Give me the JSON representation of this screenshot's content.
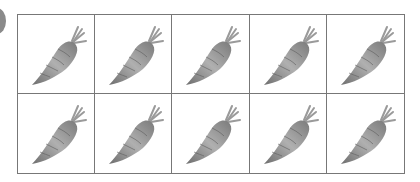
{
  "figure": {
    "item": "carrot",
    "icon": "carrot-icon",
    "rows": 2,
    "columns": 5,
    "count": 10,
    "colors": {
      "grid_line": "#777777",
      "carrot": "#8c8c8c",
      "leaf": "#a0a0a0"
    }
  },
  "cells": [
    {
      "icon": "carrot-icon"
    },
    {
      "icon": "carrot-icon"
    },
    {
      "icon": "carrot-icon"
    },
    {
      "icon": "carrot-icon"
    },
    {
      "icon": "carrot-icon"
    },
    {
      "icon": "carrot-icon"
    },
    {
      "icon": "carrot-icon"
    },
    {
      "icon": "carrot-icon"
    },
    {
      "icon": "carrot-icon"
    },
    {
      "icon": "carrot-icon"
    }
  ]
}
